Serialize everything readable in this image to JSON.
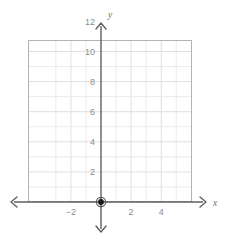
{
  "chart_data": {
    "type": "scatter",
    "title": "",
    "subtitle": "",
    "xlabel": "x",
    "ylabel": "y",
    "xlim": [
      -3.1,
      5.6
    ],
    "ylim": [
      -0.55,
      12.3
    ],
    "grid": true,
    "grid_step": 1,
    "legend": "none",
    "x_ticks": [
      -2,
      2,
      4
    ],
    "x_tick_labels": [
      "−2",
      "2",
      "4"
    ],
    "y_ticks": [
      2,
      4,
      6,
      8,
      10,
      12
    ],
    "y_tick_labels": [
      "2",
      "4",
      "6",
      "8",
      "10",
      "12"
    ],
    "points": [
      {
        "label": "origin-point",
        "x": 0,
        "y": 0
      }
    ],
    "series": [
      {
        "name": "plotted-point",
        "x": [
          0
        ],
        "y": [
          0
        ]
      }
    ],
    "annotations": [],
    "axis_arrows": [
      "left",
      "right",
      "up",
      "down"
    ]
  },
  "colors": {
    "background": "#ffffff",
    "plot_frame": "#b4b4b4",
    "gridline_minor": "#eceaea",
    "gridline_major": "#e2dede",
    "axis": "#7a7a7a",
    "axis_dark": "#5f5f5f",
    "tick_text": "#8c8c8c",
    "axis_name_text": "#6e6e6e",
    "point_fill": "#1a1a1a"
  },
  "axis_labels": {
    "x_name": "x",
    "y_name": "y"
  }
}
